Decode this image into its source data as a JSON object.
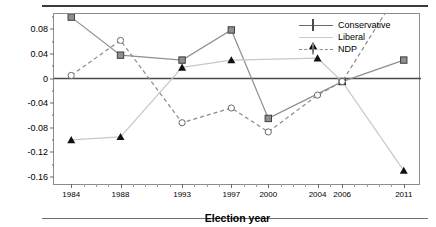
{
  "chart_data": {
    "type": "line",
    "title": "",
    "xlabel": "Election year",
    "ylabel": "Competence rating",
    "x": [
      1984,
      1988,
      1993,
      1997,
      2000,
      2004,
      2006,
      2011
    ],
    "categories": [
      "1984",
      "1988",
      "1993",
      "1997",
      "2000",
      "2004",
      "2006",
      "2011"
    ],
    "xlim": [
      1982.6,
      2012.4
    ],
    "ylim": [
      -0.175,
      0.105
    ],
    "yticks": [
      0.08,
      0.04,
      0,
      -0.04,
      -0.08,
      -0.12,
      -0.16
    ],
    "ytick_labels": [
      "0.08",
      "0.04",
      "0",
      "-0.04",
      "-0.08",
      "-0.12",
      "-0.16"
    ],
    "grid": false,
    "zero_line": true,
    "legend_position": "top-right",
    "series": [
      {
        "name": "Conservative",
        "marker": "square",
        "line": "solid",
        "color": "#8f8f8f",
        "values": [
          0.1,
          0.038,
          0.03,
          0.079,
          -0.065,
          null,
          -0.005,
          0.03
        ]
      },
      {
        "name": "Liberal",
        "marker": "triangle",
        "line": "solid",
        "color": "#c8c8c8",
        "values": [
          -0.1,
          -0.095,
          0.018,
          0.03,
          null,
          0.033,
          -0.005,
          -0.15
        ]
      },
      {
        "name": "NDP",
        "marker": "circle-open",
        "line": "dashed",
        "color": "#8a8a8a",
        "values": [
          0.005,
          0.062,
          -0.072,
          -0.048,
          -0.087,
          -0.027,
          -0.005,
          0.155
        ]
      }
    ]
  },
  "legend": {
    "items": [
      {
        "label": "Conservative"
      },
      {
        "label": "Liberal"
      },
      {
        "label": "NDP"
      }
    ]
  }
}
